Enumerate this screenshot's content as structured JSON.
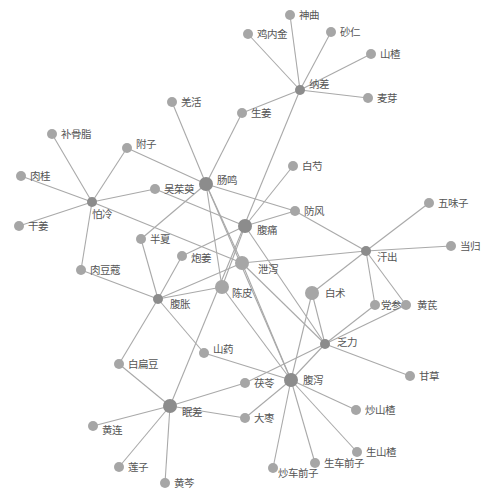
{
  "diagram": {
    "type": "network",
    "colors": {
      "background": "#ffffff",
      "edge": "#a9a9a9",
      "symptom_node": "#8c8c8c",
      "herb_node": "#a6a6a6",
      "label": "#555555"
    },
    "nodes": [
      {
        "id": "nacha",
        "label": "纳差",
        "x": 300,
        "y": 90,
        "r": 5,
        "kind": "symptom",
        "lx": 9,
        "ly": -2
      },
      {
        "id": "shenqu",
        "label": "神曲",
        "x": 290,
        "y": 15,
        "r": 5,
        "kind": "herb",
        "lx": 9,
        "ly": 4
      },
      {
        "id": "jineijin",
        "label": "鸡内金",
        "x": 248,
        "y": 34,
        "r": 5,
        "kind": "herb",
        "lx": 9,
        "ly": 4
      },
      {
        "id": "sharen",
        "label": "砂仁",
        "x": 331,
        "y": 32,
        "r": 5,
        "kind": "herb",
        "lx": 9,
        "ly": 4
      },
      {
        "id": "shanzha",
        "label": "山楂",
        "x": 371,
        "y": 54,
        "r": 5,
        "kind": "herb",
        "lx": 9,
        "ly": 4
      },
      {
        "id": "maiya",
        "label": "麦芽",
        "x": 368,
        "y": 98,
        "r": 5,
        "kind": "herb",
        "lx": 9,
        "ly": 4
      },
      {
        "id": "shengjiang",
        "label": "生姜",
        "x": 242,
        "y": 113,
        "r": 5,
        "kind": "herb",
        "lx": 9,
        "ly": 4
      },
      {
        "id": "qianghuo",
        "label": "羌活",
        "x": 172,
        "y": 102,
        "r": 5,
        "kind": "herb",
        "lx": 9,
        "ly": 4
      },
      {
        "id": "fuzi",
        "label": "附子",
        "x": 127,
        "y": 148,
        "r": 5,
        "kind": "herb",
        "lx": 9,
        "ly": 0
      },
      {
        "id": "buguzhi",
        "label": "补骨脂",
        "x": 52,
        "y": 134,
        "r": 5,
        "kind": "herb",
        "lx": 9,
        "ly": 4
      },
      {
        "id": "rougui",
        "label": "肉桂",
        "x": 21,
        "y": 176,
        "r": 5,
        "kind": "herb",
        "lx": 9,
        "ly": 4
      },
      {
        "id": "paleng",
        "label": "怕冷",
        "x": 92,
        "y": 202,
        "r": 5,
        "kind": "symptom",
        "lx": 0,
        "ly": 16
      },
      {
        "id": "ganjiang",
        "label": "干姜",
        "x": 19,
        "y": 226,
        "r": 5,
        "kind": "herb",
        "lx": 9,
        "ly": 4
      },
      {
        "id": "wuzhuyu",
        "label": "吴茱萸",
        "x": 155,
        "y": 189,
        "r": 5,
        "kind": "herb",
        "lx": 9,
        "ly": 4
      },
      {
        "id": "changming",
        "label": "肠鸣",
        "x": 206,
        "y": 184,
        "r": 7,
        "kind": "symptom",
        "lx": 11,
        "ly": 0
      },
      {
        "id": "baishao",
        "label": "白芍",
        "x": 293,
        "y": 166,
        "r": 5,
        "kind": "herb",
        "lx": 9,
        "ly": 4
      },
      {
        "id": "fangfeng",
        "label": "防风",
        "x": 295,
        "y": 211,
        "r": 5,
        "kind": "herb",
        "lx": 9,
        "ly": 4
      },
      {
        "id": "futong",
        "label": "腹痛",
        "x": 245,
        "y": 226,
        "r": 7,
        "kind": "symptom",
        "lx": 12,
        "ly": 8
      },
      {
        "id": "banxia",
        "label": "半夏",
        "x": 141,
        "y": 239,
        "r": 5,
        "kind": "herb",
        "lx": 9,
        "ly": 4
      },
      {
        "id": "paojiang",
        "label": "炮姜",
        "x": 182,
        "y": 256,
        "r": 5,
        "kind": "herb",
        "lx": 9,
        "ly": 6
      },
      {
        "id": "xiexie",
        "label": "泄泻",
        "x": 242,
        "y": 263,
        "r": 7,
        "kind": "herb",
        "lx": 16,
        "ly": 10
      },
      {
        "id": "roudoukou",
        "label": "肉豆蔻",
        "x": 81,
        "y": 270,
        "r": 5,
        "kind": "herb",
        "lx": 9,
        "ly": 4
      },
      {
        "id": "fuzhang",
        "label": "腹胀",
        "x": 158,
        "y": 299,
        "r": 5,
        "kind": "symptom",
        "lx": 12,
        "ly": 9
      },
      {
        "id": "chenpi",
        "label": "陈皮",
        "x": 222,
        "y": 287,
        "r": 7,
        "kind": "herb",
        "lx": 10,
        "ly": 10
      },
      {
        "id": "baizhu",
        "label": "白术",
        "x": 312,
        "y": 293,
        "r": 7,
        "kind": "herb",
        "lx": 13,
        "ly": 4
      },
      {
        "id": "wuweizi",
        "label": "五味子",
        "x": 429,
        "y": 203,
        "r": 5,
        "kind": "herb",
        "lx": 9,
        "ly": 4
      },
      {
        "id": "danggui",
        "label": "当归",
        "x": 451,
        "y": 246,
        "r": 5,
        "kind": "herb",
        "lx": 9,
        "ly": 4
      },
      {
        "id": "hanchu",
        "label": "汗出",
        "x": 366,
        "y": 251,
        "r": 5,
        "kind": "symptom",
        "lx": 11,
        "ly": 10
      },
      {
        "id": "dangshen",
        "label": "党参",
        "x": 375,
        "y": 305,
        "r": 5,
        "kind": "herb",
        "lx": 6,
        "ly": 4
      },
      {
        "id": "huangqi",
        "label": "黄芪",
        "x": 406,
        "y": 305,
        "r": 5,
        "kind": "herb",
        "lx": 11,
        "ly": 4
      },
      {
        "id": "fali",
        "label": "乏力",
        "x": 325,
        "y": 344,
        "r": 5,
        "kind": "symptom",
        "lx": 12,
        "ly": 2
      },
      {
        "id": "gancao",
        "label": "甘草",
        "x": 410,
        "y": 376,
        "r": 5,
        "kind": "herb",
        "lx": 9,
        "ly": 4
      },
      {
        "id": "baibiandou",
        "label": "白扁豆",
        "x": 119,
        "y": 364,
        "r": 5,
        "kind": "herb",
        "lx": 9,
        "ly": 4
      },
      {
        "id": "shanyao",
        "label": "山药",
        "x": 204,
        "y": 353,
        "r": 5,
        "kind": "herb",
        "lx": 9,
        "ly": 0
      },
      {
        "id": "fuling",
        "label": "茯苓",
        "x": 245,
        "y": 383,
        "r": 5,
        "kind": "herb",
        "lx": 9,
        "ly": 4
      },
      {
        "id": "fuxie",
        "label": "腹泻",
        "x": 291,
        "y": 380,
        "r": 7,
        "kind": "symptom",
        "lx": 12,
        "ly": 4
      },
      {
        "id": "miancha",
        "label": "眠差",
        "x": 170,
        "y": 406,
        "r": 7,
        "kind": "symptom",
        "lx": 12,
        "ly": 10
      },
      {
        "id": "dazao",
        "label": "大枣",
        "x": 245,
        "y": 418,
        "r": 5,
        "kind": "herb",
        "lx": 9,
        "ly": 4
      },
      {
        "id": "chaoshanzha",
        "label": "炒山楂",
        "x": 356,
        "y": 410,
        "r": 5,
        "kind": "herb",
        "lx": 9,
        "ly": 4
      },
      {
        "id": "huanglian",
        "label": "黄连",
        "x": 93,
        "y": 426,
        "r": 5,
        "kind": "herb",
        "lx": 9,
        "ly": 8
      },
      {
        "id": "shengshanzha",
        "label": "生山楂",
        "x": 357,
        "y": 452,
        "r": 5,
        "kind": "herb",
        "lx": 9,
        "ly": 4
      },
      {
        "id": "shengcheqianzi",
        "label": "生车前子",
        "x": 315,
        "y": 463,
        "r": 5,
        "kind": "herb",
        "lx": 9,
        "ly": 4
      },
      {
        "id": "lianzi",
        "label": "莲子",
        "x": 119,
        "y": 467,
        "r": 5,
        "kind": "herb",
        "lx": 9,
        "ly": 4
      },
      {
        "id": "chaocheqianzi",
        "label": "炒车前子",
        "x": 273,
        "y": 468,
        "r": 5,
        "kind": "herb",
        "lx": 5,
        "ly": 9
      },
      {
        "id": "huangqin",
        "label": "黄芩",
        "x": 165,
        "y": 483,
        "r": 5,
        "kind": "herb",
        "lx": 9,
        "ly": 4
      }
    ],
    "edges": [
      [
        "nacha",
        "shenqu"
      ],
      [
        "nacha",
        "jineijin"
      ],
      [
        "nacha",
        "sharen"
      ],
      [
        "nacha",
        "shanzha"
      ],
      [
        "nacha",
        "maiya"
      ],
      [
        "nacha",
        "shengjiang"
      ],
      [
        "nacha",
        "miancha"
      ],
      [
        "changming",
        "qianghuo"
      ],
      [
        "changming",
        "shengjiang"
      ],
      [
        "changming",
        "fuzi"
      ],
      [
        "changming",
        "fangfeng"
      ],
      [
        "changming",
        "banxia"
      ],
      [
        "changming",
        "chenpi"
      ],
      [
        "changming",
        "xiexie"
      ],
      [
        "changming",
        "fuxie"
      ],
      [
        "paleng",
        "buguzhi"
      ],
      [
        "paleng",
        "rougui"
      ],
      [
        "paleng",
        "ganjiang"
      ],
      [
        "paleng",
        "fuzi"
      ],
      [
        "paleng",
        "wuzhuyu"
      ],
      [
        "paleng",
        "roudoukou"
      ],
      [
        "paleng",
        "xiexie"
      ],
      [
        "futong",
        "wuzhuyu"
      ],
      [
        "futong",
        "baishao"
      ],
      [
        "futong",
        "fangfeng"
      ],
      [
        "futong",
        "paojiang"
      ],
      [
        "futong",
        "chenpi"
      ],
      [
        "futong",
        "fali"
      ],
      [
        "fuzhang",
        "banxia"
      ],
      [
        "fuzhang",
        "paojiang"
      ],
      [
        "fuzhang",
        "roudoukou"
      ],
      [
        "fuzhang",
        "xiexie"
      ],
      [
        "fuzhang",
        "chenpi"
      ],
      [
        "fuzhang",
        "shanyao"
      ],
      [
        "fuzhang",
        "baibiandou"
      ],
      [
        "hanchu",
        "fangfeng"
      ],
      [
        "hanchu",
        "wuweizi"
      ],
      [
        "hanchu",
        "danggui"
      ],
      [
        "hanchu",
        "xiexie"
      ],
      [
        "hanchu",
        "baizhu"
      ],
      [
        "hanchu",
        "dangshen"
      ],
      [
        "hanchu",
        "huangqi"
      ],
      [
        "fali",
        "baizhu"
      ],
      [
        "fali",
        "dangshen"
      ],
      [
        "fali",
        "huangqi"
      ],
      [
        "fali",
        "gancao"
      ],
      [
        "fali",
        "xiexie"
      ],
      [
        "fali",
        "fuling"
      ],
      [
        "fali",
        "fuxie"
      ],
      [
        "fuxie",
        "baizhu"
      ],
      [
        "fuxie",
        "xiexie"
      ],
      [
        "fuxie",
        "chenpi"
      ],
      [
        "fuxie",
        "shanyao"
      ],
      [
        "fuxie",
        "dazao"
      ],
      [
        "fuxie",
        "chaoshanzha"
      ],
      [
        "fuxie",
        "shengshanzha"
      ],
      [
        "fuxie",
        "shengcheqianzi"
      ],
      [
        "fuxie",
        "chaocheqianzi"
      ],
      [
        "miancha",
        "fuling"
      ],
      [
        "miancha",
        "dazao"
      ],
      [
        "miancha",
        "huanglian"
      ],
      [
        "miancha",
        "lianzi"
      ],
      [
        "miancha",
        "huangqin"
      ],
      [
        "miancha",
        "baibiandou"
      ]
    ]
  }
}
